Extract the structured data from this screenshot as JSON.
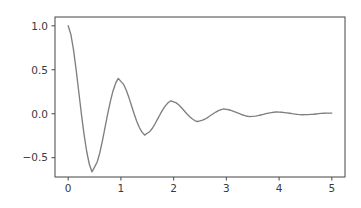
{
  "figure": {
    "background_color": "#ffffff",
    "axes_background_color": "#ffffff",
    "spine_color": "#555555",
    "tick_label_color": "#3b3b3b"
  },
  "chart_data": {
    "type": "line",
    "title": "",
    "subtitle": "",
    "xlabel": "",
    "ylabel": "",
    "legend": [],
    "legend_position": "none",
    "grid": false,
    "xlim": [
      -0.25,
      5.25
    ],
    "ylim": [
      -0.72,
      1.1
    ],
    "xticks": [
      0,
      1,
      2,
      3,
      4,
      5
    ],
    "xtick_labels": [
      "0",
      "1",
      "2",
      "3",
      "4",
      "5"
    ],
    "yticks": [
      -0.5,
      0.0,
      0.5,
      1.0
    ],
    "ytick_labels": [
      "−0.5",
      "0.0",
      "0.5",
      "1.0"
    ],
    "series": [
      {
        "name": "damped_oscillation",
        "color": "#7f7f7f",
        "linewidth": 1.35,
        "formula": "exp(-t) * cos(2*pi*t)",
        "x": [
          0.0,
          0.05,
          0.1,
          0.15,
          0.2,
          0.25,
          0.3,
          0.35,
          0.4,
          0.45,
          0.5,
          0.55,
          0.6,
          0.65,
          0.7,
          0.75,
          0.8,
          0.85,
          0.9,
          0.95,
          1.0,
          1.05,
          1.1,
          1.15,
          1.2,
          1.25,
          1.3,
          1.35,
          1.4,
          1.45,
          1.5,
          1.55,
          1.6,
          1.65,
          1.7,
          1.75,
          1.8,
          1.85,
          1.9,
          1.95,
          2.0,
          2.05,
          2.1,
          2.15,
          2.2,
          2.25,
          2.3,
          2.35,
          2.4,
          2.45,
          2.5,
          2.55,
          2.6,
          2.65,
          2.7,
          2.75,
          2.8,
          2.85,
          2.9,
          2.95,
          3.0,
          3.05,
          3.1,
          3.15,
          3.2,
          3.25,
          3.3,
          3.35,
          3.4,
          3.45,
          3.5,
          3.55,
          3.6,
          3.65,
          3.7,
          3.75,
          3.8,
          3.85,
          3.9,
          3.95,
          4.0,
          4.05,
          4.1,
          4.15,
          4.2,
          4.25,
          4.3,
          4.35,
          4.4,
          4.45,
          4.5,
          4.55,
          4.6,
          4.65,
          4.7,
          4.75,
          4.8,
          4.85,
          4.9,
          4.95,
          5.0
        ],
        "y": [
          1.0,
          0.904,
          0.732,
          0.505,
          0.253,
          0.0,
          -0.232,
          -0.427,
          -0.572,
          -0.661,
          -0.607,
          -0.55,
          -0.444,
          -0.306,
          -0.153,
          0.0,
          0.141,
          0.259,
          0.347,
          0.401,
          0.368,
          0.334,
          0.269,
          0.186,
          0.093,
          0.0,
          -0.085,
          -0.157,
          -0.21,
          -0.243,
          -0.223,
          -0.202,
          -0.163,
          -0.112,
          -0.056,
          0.0,
          0.052,
          0.095,
          0.128,
          0.147,
          0.135,
          0.123,
          0.099,
          0.068,
          0.034,
          0.0,
          -0.031,
          -0.058,
          -0.078,
          -0.089,
          -0.082,
          -0.074,
          -0.06,
          -0.041,
          -0.021,
          0.0,
          0.019,
          0.035,
          0.047,
          0.054,
          0.05,
          0.045,
          0.036,
          0.025,
          0.012,
          0.0,
          -0.012,
          -0.021,
          -0.029,
          -0.033,
          -0.03,
          -0.027,
          -0.022,
          -0.015,
          -0.008,
          0.0,
          0.007,
          0.013,
          0.017,
          0.02,
          0.018,
          0.017,
          0.013,
          0.009,
          0.005,
          0.0,
          -0.004,
          -0.008,
          -0.011,
          -0.012,
          -0.011,
          -0.01,
          -0.008,
          -0.006,
          -0.003,
          0.0,
          0.003,
          0.005,
          0.006,
          0.007,
          0.007
        ],
        "key_points": {
          "start": [
            0.0,
            1.0
          ],
          "first_trough": [
            0.5,
            -0.607
          ],
          "first_peak": [
            1.0,
            0.368
          ],
          "second_trough": [
            1.5,
            -0.223
          ],
          "second_peak": [
            2.0,
            0.135
          ],
          "third_trough": [
            2.5,
            -0.082
          ],
          "third_peak": [
            3.0,
            0.05
          ],
          "fourth_trough": [
            3.5,
            -0.03
          ],
          "fourth_peak": [
            4.0,
            0.018
          ],
          "end": [
            5.0,
            0.007
          ]
        }
      }
    ]
  }
}
